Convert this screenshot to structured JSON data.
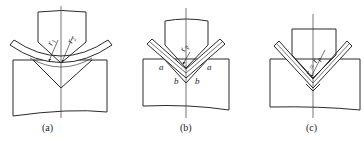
{
  "figure": {
    "panels": [
      {
        "id": "a",
        "caption": "(a)",
        "labels": {
          "r1": "r",
          "r1_sub": "1",
          "r2": "r",
          "r2_sub": "2"
        }
      },
      {
        "id": "b",
        "caption": "(b)",
        "labels": {
          "rp": "r",
          "rp_sub": "p",
          "a_left": "a",
          "a_right": "a",
          "b_left": "b",
          "b_right": "b"
        }
      },
      {
        "id": "c",
        "caption": "(c)",
        "labels": {
          "r_eq": "r = r",
          "r_eq_sub": "p"
        }
      }
    ],
    "colors": {
      "line": "#2a2a2a",
      "background": "#ffffff"
    }
  }
}
